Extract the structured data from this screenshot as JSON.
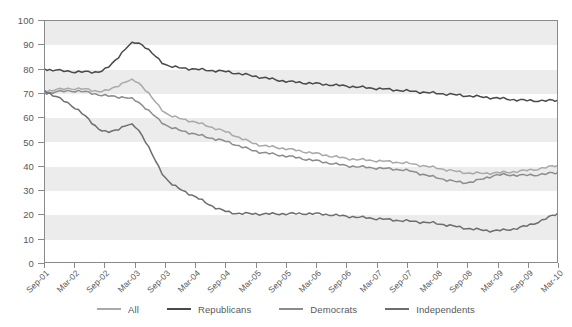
{
  "chart_data": {
    "type": "line",
    "title": "",
    "xlabel": "",
    "ylabel": "",
    "ylim": [
      0,
      100
    ],
    "yticks": [
      0,
      10,
      20,
      30,
      40,
      50,
      60,
      70,
      80,
      90,
      100
    ],
    "grid": "horizontal-alternating-bands",
    "legend_position": "bottom-center",
    "categories": [
      "Sep-01",
      "Mar-02",
      "Sep-02",
      "Mar-03",
      "Sep-03",
      "Mar-04",
      "Sep-04",
      "Mar-05",
      "Sep-05",
      "Mar-06",
      "Sep-06",
      "Mar-07",
      "Sep-07",
      "Mar-08",
      "Sep-08",
      "Mar-09",
      "Sep-09",
      "Mar-10"
    ],
    "series": [
      {
        "name": "All",
        "color": "#a9a9ab",
        "values": [
          71,
          72,
          71,
          75,
          62,
          58,
          54,
          49,
          47,
          45,
          43,
          42,
          41,
          39,
          37,
          37,
          38,
          40
        ]
      },
      {
        "name": "Republicans",
        "color": "#4a4a4c",
        "values": [
          80,
          79,
          80,
          91,
          82,
          80,
          79,
          77,
          75,
          74,
          73,
          72,
          71,
          70,
          69,
          68,
          67,
          67
        ]
      },
      {
        "name": "Democrats",
        "color": "#8c8c8e",
        "values": [
          70,
          71,
          69,
          67,
          57,
          53,
          50,
          46,
          44,
          42,
          40,
          39,
          38,
          35,
          33,
          36,
          36,
          37
        ]
      },
      {
        "name": "Independents",
        "color": "#6e6e70",
        "values": [
          71,
          64,
          54,
          56,
          35,
          27,
          21,
          20,
          20,
          20,
          19,
          18,
          17,
          16,
          14,
          13,
          15,
          20
        ]
      }
    ],
    "annotations": {
      "spike_period": "Mar-03",
      "note": "All series show a peak around Mar-03"
    }
  },
  "legend": {
    "items": [
      {
        "label": "All",
        "color": "#a9a9ab"
      },
      {
        "label": "Republicans",
        "color": "#4a4a4c"
      },
      {
        "label": "Democrats",
        "color": "#8c8c8e"
      },
      {
        "label": "Independents",
        "color": "#6e6e70"
      }
    ]
  },
  "axis": {
    "y_tick_labels": [
      "100",
      "90",
      "80",
      "70",
      "60",
      "50",
      "40",
      "30",
      "20",
      "10",
      "0"
    ],
    "x_tick_labels": [
      "Sep-01",
      "Mar-02",
      "Sep-02",
      "Mar-03",
      "Sep-03",
      "Mar-04",
      "Sep-04",
      "Mar-05",
      "Sep-05",
      "Mar-06",
      "Sep-06",
      "Mar-07",
      "Sep-07",
      "Mar-08",
      "Sep-08",
      "Mar-09",
      "Sep-09",
      "Mar-10"
    ]
  },
  "top_sliver": {
    "text": ""
  }
}
